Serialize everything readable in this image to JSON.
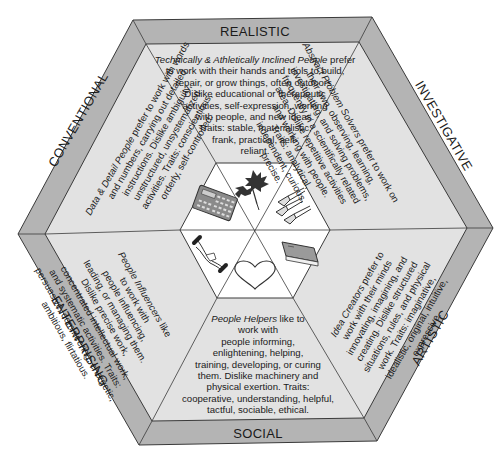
{
  "diagram": {
    "colors": {
      "band": "#b4b4b4",
      "band_dark": "#a8a8a8",
      "segment": "#e2e2e2",
      "center": "#ffffff",
      "stroke": "#3a3a3a",
      "text": "#1a1a1a"
    },
    "types": [
      {
        "id": "realistic",
        "label": "REALISTIC",
        "lead": "Technically & Athletically Inclined People",
        "lines": [
          "Technically & Athletically Inclined People prefer",
          "to work with their hands and tools to build,",
          "repair, or grow things, often outdoors.",
          "Dislike educational or therapeutic",
          "activities, self-expression, working",
          "with people, and new ideas.",
          "Traits: stable, materialistic,",
          "frank, practical, self-",
          "reliant."
        ],
        "icon": "maple-leaf-icon"
      },
      {
        "id": "investigative",
        "label": "INVESTIGATIVE",
        "lead": "Abstract Problem Solvers",
        "lines": [
          "Abstract Problem Solvers prefer to work on",
          "their own, observing, learning,",
          "investigating, and solving problems,",
          "frequently in a scientifically related",
          "area. Dislike repetitive activities",
          "and working with people.",
          "Traits: analytical,",
          "independent, curious,",
          "precise."
        ],
        "icon": "lab-flasks-icon"
      },
      {
        "id": "artistic",
        "label": "ARTISTIC",
        "lead": "Idea Creators",
        "lines": [
          "Idea Creators prefer to",
          "work with their minds",
          "innovating, imagining, and",
          "creating. Dislike structured",
          "situations, rules, and physical",
          "work. Traits: imaginative,",
          "idealistic, original, intuitive,",
          "expressive."
        ],
        "icon": "book-icon"
      },
      {
        "id": "social",
        "label": "SOCIAL",
        "lead": "People Helpers",
        "lines": [
          "People Helpers like to",
          "work with",
          "people informing,",
          "enlightening, helping,",
          "training, developing, or curing",
          "them. Dislike machinery and",
          "physical exertion. Traits:",
          "cooperative, understanding, helpful,",
          "tactful, sociable, ethical."
        ],
        "icon": "heart-icon"
      },
      {
        "id": "enterprising",
        "label": "ENTERPRISING",
        "lead": "People Influencers",
        "lines": [
          "People Influencers like",
          "to work with",
          "people influencing,",
          "leading, or managing them.",
          "Dislike precise work,",
          "concentrated intellectual work,",
          "and systematic activities. Traits:",
          "persuasive, domineering, energetic,",
          "ambitious, flirtatious."
        ],
        "icon": "handshake-icon"
      },
      {
        "id": "conventional",
        "label": "CONVENTIONAL",
        "lead": "Data & Detail People",
        "lines": [
          "Data & Detail People prefer to work with words",
          "and numbers, carrying out detailed",
          "instructions. Dislike ambiguity,",
          "unstructured, unsystematized",
          "activities. Traits: conscientious,",
          "orderly, self-controlled."
        ],
        "icon": "calculator-icon"
      }
    ]
  }
}
